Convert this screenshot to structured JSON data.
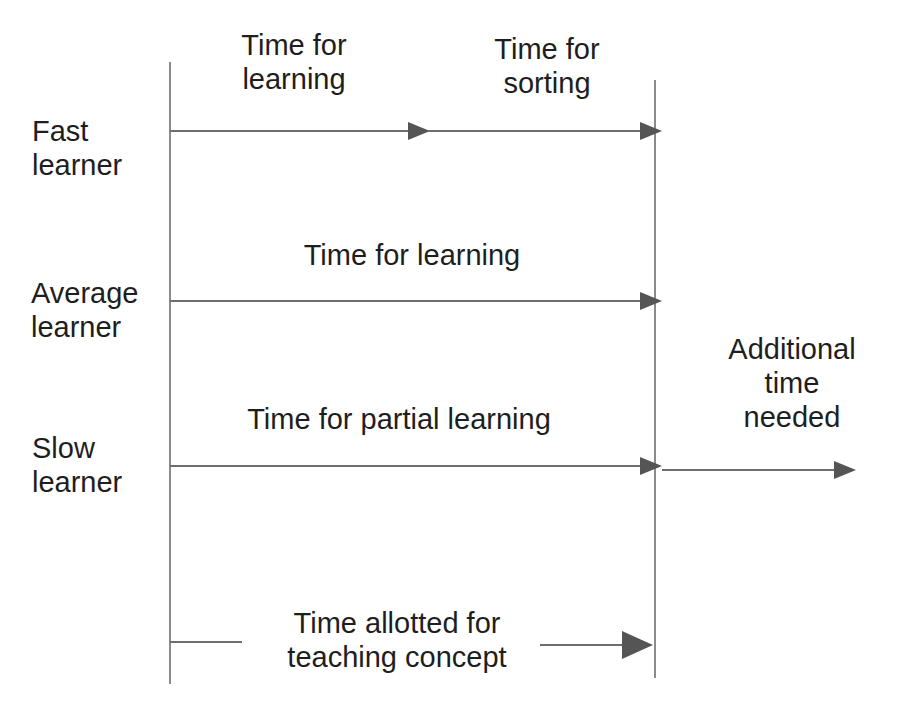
{
  "diagram": {
    "title": "",
    "colors": {
      "line": "#6e6e6e",
      "arrowhead": "#555555",
      "text": "#1e1e1e",
      "background": "#ffffff"
    },
    "rows": [
      {
        "name": "Fast learner",
        "label_line1": "Fast",
        "label_line2": "learner",
        "segments": [
          {
            "label_line1": "Time for",
            "label_line2": "learning"
          },
          {
            "label_line1": "Time for",
            "label_line2": "sorting"
          }
        ]
      },
      {
        "name": "Average learner",
        "label_line1": "Average",
        "label_line2": "learner",
        "segments": [
          {
            "label": "Time for learning"
          }
        ]
      },
      {
        "name": "Slow learner",
        "label_line1": "Slow",
        "label_line2": "learner",
        "segments": [
          {
            "label": "Time for partial learning"
          },
          {
            "label_line1": "Additional",
            "label_line2": "time",
            "label_line3": "needed"
          }
        ]
      }
    ],
    "allotted": {
      "label_line1": "Time allotted for",
      "label_line2": "teaching concept"
    }
  }
}
